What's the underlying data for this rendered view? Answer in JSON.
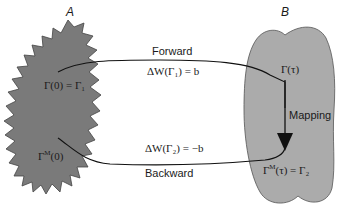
{
  "diagram": {
    "region_a": {
      "label": "A",
      "state_upper": "Γ(0) = Γ₁",
      "state_lower_base": "Γ",
      "state_lower_sup": "M",
      "state_lower_tail": "(0)",
      "fill": "#7a7a7a"
    },
    "region_b": {
      "label": "B",
      "state_upper": "Γ(τ)",
      "state_lower_base": "Γ",
      "state_lower_sup": "M",
      "state_lower_tail": "(τ) = Γ₂",
      "fill": "#ababab"
    },
    "forward": {
      "label": "Forward",
      "equation": "ΔW(Γ₁) = b"
    },
    "backward": {
      "label": "Backward",
      "equation": "ΔW(Γ₂) = −b"
    },
    "mapping": {
      "label": "Mapping"
    }
  }
}
